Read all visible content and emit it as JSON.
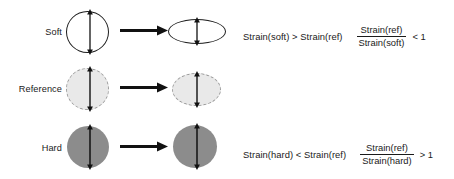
{
  "figure": {
    "colors": {
      "stroke": "#1d1d1d",
      "reference_fill": "#e9e9e9",
      "reference_stroke": "#9a9a9a",
      "hard_fill": "#8c8c8c",
      "background": "#ffffff"
    }
  },
  "rows": [
    {
      "label": "Soft",
      "undeformed": {
        "shape": "circle",
        "fill": "none",
        "stroke": "solid",
        "arrow": "double-headed-vertical-arrow"
      },
      "arrow": "right-arrow",
      "deformed": {
        "shape": "ellipse-flat",
        "fill": "none",
        "stroke": "solid",
        "arrow": "double-headed-vertical-arrow"
      },
      "equation": {
        "inequality": "Strain(soft) > Strain(ref)",
        "numerator": "Strain(ref)",
        "denominator": "Strain(soft)",
        "comparison": "< 1"
      }
    },
    {
      "label": "Reference",
      "undeformed": {
        "shape": "circle",
        "fill": "light-gray",
        "stroke": "dashed",
        "arrow": "double-headed-vertical-arrow"
      },
      "arrow": "right-arrow",
      "deformed": {
        "shape": "ellipse",
        "fill": "light-gray",
        "stroke": "dashed",
        "arrow": "double-headed-vertical-arrow"
      },
      "equation": null
    },
    {
      "label": "Hard",
      "undeformed": {
        "shape": "circle",
        "fill": "medium-gray",
        "stroke": "none",
        "arrow": "double-headed-vertical-arrow"
      },
      "arrow": "right-arrow",
      "deformed": {
        "shape": "circle-slight-ellipse",
        "fill": "medium-gray",
        "stroke": "none",
        "arrow": "double-headed-vertical-arrow"
      },
      "equation": {
        "inequality": "Strain(hard) < Strain(ref)",
        "numerator": "Strain(ref)",
        "denominator": "Strain(hard)",
        "comparison": "> 1"
      }
    }
  ]
}
